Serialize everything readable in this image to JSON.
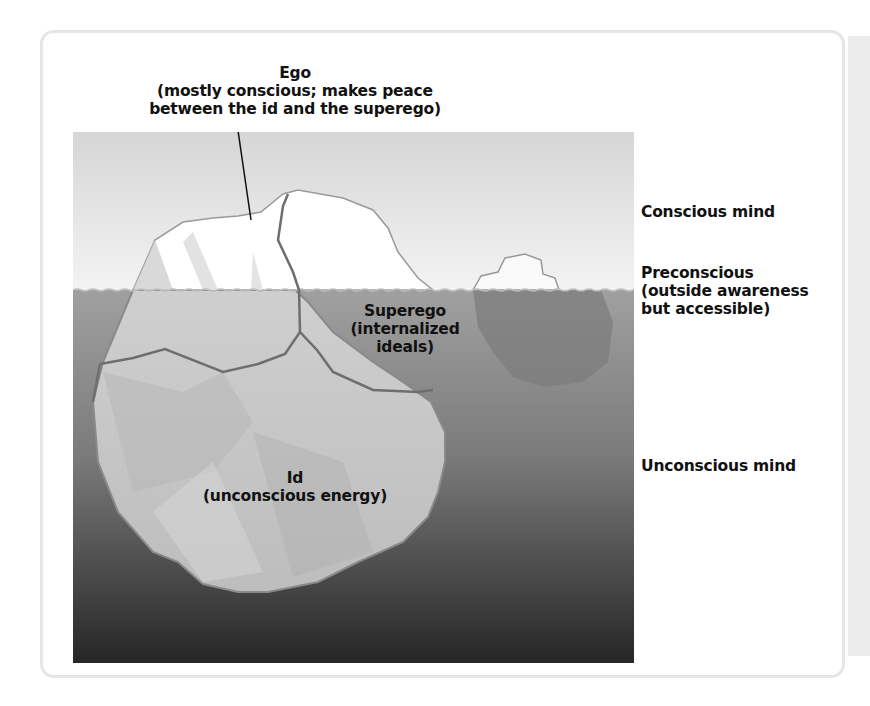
{
  "diagram": {
    "type": "iceberg-model-of-mind",
    "colors": {
      "sky_top": "#d8d8d8",
      "sky_bottom": "#f4f4f4",
      "water_top": "#9a9a9a",
      "water_bottom": "#2a2a2a",
      "ice_above": "#ffffff",
      "ice_below": "#c9c9c9",
      "outline": "#7a7a7a",
      "text": "#111111"
    },
    "labels": {
      "ego": {
        "title": "Ego",
        "line1": "(mostly conscious; makes peace",
        "line2": "between the id and the superego)"
      },
      "superego": {
        "title": "Superego",
        "line1": "(internalized",
        "line2": "ideals)"
      },
      "id": {
        "title": "Id",
        "line1": "(unconscious energy)"
      }
    },
    "levels": {
      "conscious": "Conscious mind",
      "preconscious": {
        "title": "Preconscious",
        "line1": "(outside awareness",
        "line2": "but accessible)"
      },
      "unconscious": "Unconscious mind"
    }
  }
}
